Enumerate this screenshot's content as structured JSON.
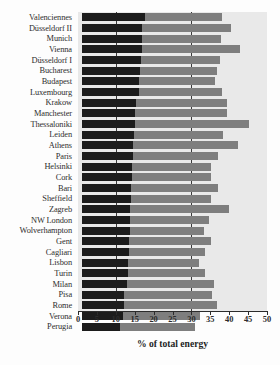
{
  "chart_data": {
    "type": "bar",
    "orientation": "horizontal",
    "stacked": true,
    "title": "",
    "xlabel": "% of total energy",
    "ylabel": "",
    "xlim": [
      0,
      50
    ],
    "xticks": [
      0,
      5,
      10,
      15,
      20,
      25,
      30,
      35,
      40,
      45,
      50
    ],
    "xtick_labels": [
      "0",
      "5",
      "10",
      "15",
      "20",
      "25",
      "30",
      "35",
      "40",
      "45",
      "50"
    ],
    "gridlines_x": [
      10,
      30
    ],
    "grid": true,
    "legend": null,
    "colors": {
      "segment_1": "#1c1c1c",
      "segment_2": "#7e7e7e",
      "panel": "#e9e9e9"
    },
    "categories": [
      "Valenciennes",
      "Düsseldorf II",
      "Munich",
      "Vienna",
      "Düsseldorf I",
      "Bucharest",
      "Budapest",
      "Luxembourg",
      "Krakow",
      "Manchester",
      "Thessaloniki",
      "Leiden",
      "Athens",
      "Paris",
      "Helsinki",
      "Cork",
      "Bari",
      "Sheffield",
      "Zagreb",
      "NW London",
      "Wolverhampton",
      "Gent",
      "Cagliari",
      "Lisbon",
      "Turin",
      "Milan",
      "Pisa",
      "Rome",
      "Verona",
      "Perugia"
    ],
    "series": [
      {
        "name": "segment_1",
        "values": [
          16.6,
          16.0,
          15.9,
          15.8,
          15.6,
          15.4,
          15.2,
          15.0,
          14.2,
          14.0,
          13.9,
          13.8,
          13.6,
          13.5,
          13.3,
          13.1,
          13.0,
          12.9,
          12.8,
          12.7,
          12.6,
          12.5,
          12.4,
          12.2,
          12.1,
          12.0,
          11.2,
          11.0,
          10.8,
          10.0
        ]
      },
      {
        "name": "segment_2",
        "values": [
          20.4,
          23.5,
          20.9,
          26.0,
          20.8,
          20.3,
          20.1,
          22.0,
          24.1,
          24.3,
          30.2,
          23.6,
          27.8,
          22.5,
          20.7,
          21.1,
          23.0,
          21.3,
          26.2,
          20.9,
          19.6,
          21.5,
          20.2,
          18.8,
          20.5,
          23.0,
          23.3,
          24.6,
          20.4,
          20.0
        ]
      }
    ],
    "totals": [
      37.0,
      39.5,
      36.8,
      41.8,
      36.4,
      35.7,
      35.3,
      37.0,
      38.3,
      38.3,
      44.1,
      37.4,
      41.4,
      36.0,
      34.0,
      34.2,
      36.0,
      34.2,
      39.0,
      33.6,
      32.2,
      34.0,
      32.6,
      31.0,
      32.6,
      35.0,
      34.5,
      35.6,
      31.2,
      30.0
    ]
  }
}
